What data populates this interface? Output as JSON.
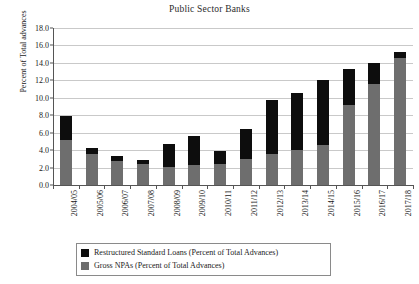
{
  "chart_data": {
    "type": "bar",
    "title": "Public Sector Banks",
    "xlabel": "",
    "ylabel": "Percent of Total advances",
    "ylim": [
      0.0,
      18.0
    ],
    "ytick_step": 2.0,
    "ytick_labels": [
      "0.0",
      "2.0",
      "4.0",
      "6.0",
      "8.0",
      "10.0",
      "12.0",
      "14.0",
      "16.0",
      "18.0"
    ],
    "grid": true,
    "stacked": true,
    "legend_position": "bottom",
    "categories": [
      "2004/05",
      "2005/06",
      "2006/07",
      "2007/08",
      "2008/09",
      "2009/10",
      "2010/11",
      "2011/12",
      "2012/13",
      "2013/14",
      "2014/15",
      "2015/16",
      "2016/17",
      "2017/18"
    ],
    "series": [
      {
        "name": "Gross NPAs (Percent of Total Advances)",
        "color": "#6e6e6e",
        "values": [
          5.2,
          3.6,
          2.7,
          2.4,
          2.1,
          2.3,
          2.4,
          3.0,
          3.5,
          4.0,
          4.6,
          9.2,
          11.6,
          14.6
        ]
      },
      {
        "name": "Restructured Standard Loans (Percent of Total Advances)",
        "color": "#0d0d0d",
        "values": [
          2.7,
          0.6,
          0.6,
          0.5,
          2.6,
          3.3,
          1.5,
          3.4,
          6.2,
          6.6,
          7.4,
          4.1,
          2.4,
          0.7
        ]
      }
    ],
    "totals": [
      7.9,
      4.2,
      3.3,
      2.9,
      4.7,
      5.6,
      3.9,
      6.4,
      9.7,
      10.6,
      12.0,
      13.3,
      14.0,
      15.3
    ]
  },
  "legend": {
    "items": [
      {
        "label": "Restructured Standard Loans (Percent of Total Advances)",
        "swatch": "black"
      },
      {
        "label": "Gross NPAs (Percent of Total Advances)",
        "swatch": "gray"
      }
    ]
  }
}
